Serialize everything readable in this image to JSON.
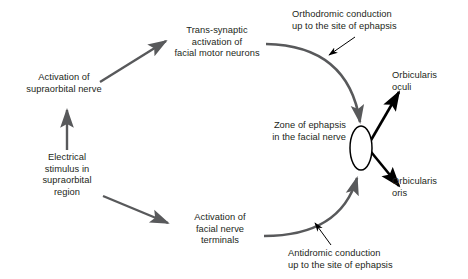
{
  "diagram": {
    "type": "flow-diagram",
    "background_color": "#ffffff",
    "arrow_color_primary": "#58595b",
    "arrow_color_secondary": "#000000",
    "text_color": "#231f20",
    "nodes": [
      {
        "id": "activation-supraorbital-nerve",
        "text": "Activation of\nsupraorbital nerve"
      },
      {
        "id": "trans-synaptic-activation",
        "text": "Trans-synaptic\nactivation of\nfacial motor neurons"
      },
      {
        "id": "orthodromic-conduction",
        "text": "Orthodromic conduction\nup to the site of ephapsis"
      },
      {
        "id": "orbicularis-oculi",
        "text": "Orbicularis\noculi"
      },
      {
        "id": "zone-of-ephapsis",
        "text": "Zone of ephapsis\nin the facial nerve"
      },
      {
        "id": "electrical-stimulus",
        "text": "Electrical\nstimulus in\nsupraorbital\nregion"
      },
      {
        "id": "orbicularis-oris",
        "text": "Orbicularis\noris"
      },
      {
        "id": "activation-facial-nerve-terminals",
        "text": "Activation of\nfacial nerve\nterminals"
      },
      {
        "id": "antidromic-conduction",
        "text": "Antidromic conduction\nup to the site of ephapsis"
      }
    ],
    "edges": [
      {
        "id": "stimulus-to-supraorbital",
        "from": "electrical-stimulus",
        "to": "activation-supraorbital-nerve",
        "style": "straight"
      },
      {
        "id": "supraorbital-to-transsynaptic",
        "from": "activation-supraorbital-nerve",
        "to": "trans-synaptic-activation",
        "style": "straight"
      },
      {
        "id": "transsynaptic-to-ephapsis",
        "from": "trans-synaptic-activation",
        "to": "zone-of-ephapsis",
        "style": "curved"
      },
      {
        "id": "stimulus-to-terminals",
        "from": "electrical-stimulus",
        "to": "activation-facial-nerve-terminals",
        "style": "straight"
      },
      {
        "id": "terminals-to-ephapsis",
        "from": "activation-facial-nerve-terminals",
        "to": "zone-of-ephapsis",
        "style": "curved"
      },
      {
        "id": "ephapsis-to-oculi",
        "from": "zone-of-ephapsis",
        "to": "orbicularis-oculi",
        "style": "straight"
      },
      {
        "id": "ephapsis-to-oris",
        "from": "zone-of-ephapsis",
        "to": "orbicularis-oris",
        "style": "straight"
      }
    ],
    "annotations": [
      {
        "id": "orthodromic-pointer",
        "labels": "orthodromic-conduction"
      },
      {
        "id": "antidromic-pointer",
        "labels": "antidromic-conduction"
      }
    ],
    "shapes": [
      {
        "id": "ephapsis-ellipse",
        "shape": "ellipse",
        "fill": "#ffffff",
        "stroke": "#000000"
      }
    ]
  }
}
